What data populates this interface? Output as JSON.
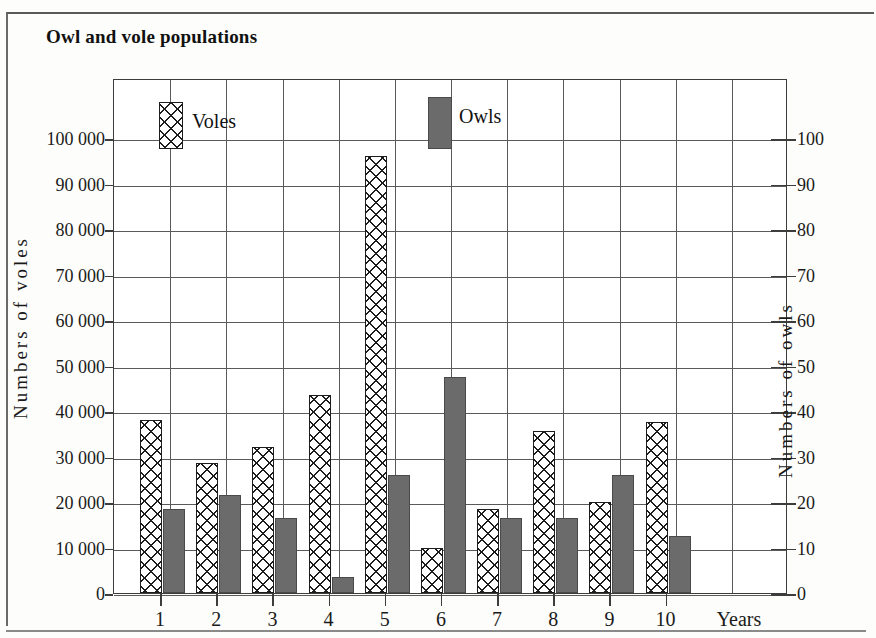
{
  "title": "Owl and vole populations",
  "legend": [
    {
      "label": "Voles",
      "pattern": "crosshatch",
      "color": "#ffffff"
    },
    {
      "label": "Owls",
      "pattern": "solid",
      "color": "#6b6b6b"
    }
  ],
  "axes": {
    "left_title": "Numbers of voles",
    "right_title": "Numbers of owls",
    "x_title": "Years",
    "left_ticks": [
      "0",
      "10 000",
      "20 000",
      "30 000",
      "40 000",
      "50 000",
      "60 000",
      "70 000",
      "80 000",
      "90 000",
      "100 000"
    ],
    "right_ticks": [
      "0",
      "10",
      "20",
      "30",
      "40",
      "50",
      "60",
      "70",
      "80",
      "90",
      "100"
    ],
    "x_ticks": [
      "1",
      "2",
      "3",
      "4",
      "5",
      "6",
      "7",
      "8",
      "9",
      "10"
    ]
  },
  "chart_data": {
    "type": "bar",
    "title": "Owl and vole populations",
    "xlabel": "Years",
    "ylabel": "Numbers of voles",
    "y2label": "Numbers of owls",
    "categories": [
      "1",
      "2",
      "3",
      "4",
      "5",
      "6",
      "7",
      "8",
      "9",
      "10"
    ],
    "ylim": [
      0,
      100000
    ],
    "y2lim": [
      0,
      100
    ],
    "ytick_step": 10000,
    "y2tick_step": 10,
    "grid": true,
    "legend_position": "inside-top",
    "series": [
      {
        "name": "Voles",
        "axis": "left",
        "units": "voles",
        "values": [
          38000,
          28500,
          32000,
          43500,
          96000,
          10000,
          18500,
          35500,
          20000,
          37500
        ]
      },
      {
        "name": "Owls",
        "axis": "right",
        "units": "owls",
        "values": [
          18.5,
          21.5,
          16.5,
          3.5,
          26,
          47.5,
          16.5,
          16.5,
          26,
          12.5
        ]
      }
    ]
  }
}
